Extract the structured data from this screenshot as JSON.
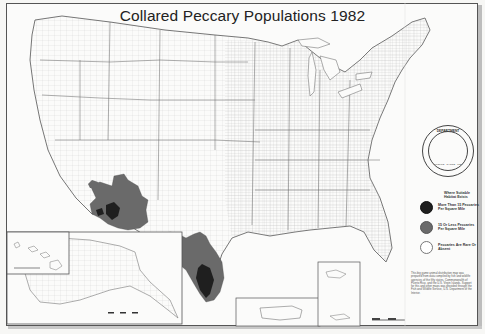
{
  "map": {
    "title": "Collared Peccary Populations 1982",
    "legend": {
      "heading": "Where Suitable Habitat Exists",
      "items": [
        {
          "label": "More Than 15 Peccaries Per Square Mile",
          "color": "#1f1f1f"
        },
        {
          "label": "15 Or Less Peccaries Per Square Mile",
          "color": "#6a6a6a"
        },
        {
          "label": "Peccaries Are Rare Or Absent",
          "color": "#ffffff"
        }
      ]
    },
    "seal": {
      "top_text": "DEPARTMENT",
      "bottom_text": "WILDLIFE · RANGE · FISH"
    },
    "note": "This big game animal distribution map was prepared from data compiled by fish and wildlife agencies of the fifty states, Commonwealth of Puerto Rico, and the U.S. Virgin Islands. Support for this and other maps was provided through the Fish and Wildlife Service, U.S. Department of the Interior.",
    "insets": [
      "Alaska",
      "Hawaii",
      "Puerto Rico",
      "Virgin Islands"
    ],
    "colors": {
      "high_density": "#1f1f1f",
      "low_density": "#6a6a6a",
      "background": "#fbfbfa",
      "lines": "#8a8a8a"
    }
  }
}
